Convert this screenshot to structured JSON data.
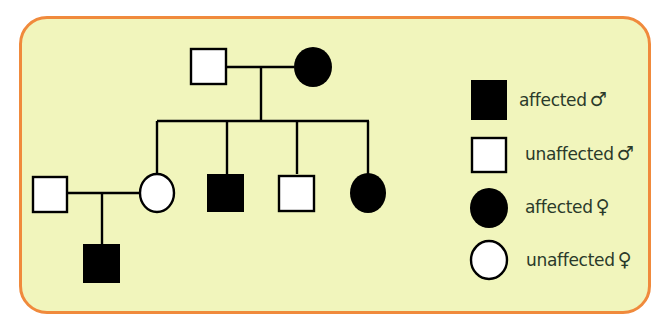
{
  "diagram": {
    "type": "pedigree chart",
    "generations": [
      {
        "gen": 1,
        "individuals": [
          {
            "id": "I-1",
            "sex": "male",
            "status": "unaffected"
          },
          {
            "id": "I-2",
            "sex": "female",
            "status": "affected"
          }
        ]
      },
      {
        "gen": 2,
        "individuals": [
          {
            "id": "II-spouse",
            "sex": "male",
            "status": "unaffected",
            "married_in": true
          },
          {
            "id": "II-1",
            "sex": "female",
            "status": "unaffected"
          },
          {
            "id": "II-2",
            "sex": "male",
            "status": "affected"
          },
          {
            "id": "II-3",
            "sex": "male",
            "status": "unaffected"
          },
          {
            "id": "II-4",
            "sex": "female",
            "status": "affected"
          }
        ]
      },
      {
        "gen": 3,
        "individuals": [
          {
            "id": "III-1",
            "sex": "male",
            "status": "affected"
          }
        ]
      }
    ]
  },
  "legend": {
    "items": [
      {
        "shape": "square",
        "fill": "black",
        "label": "affected",
        "symbol": "♂"
      },
      {
        "shape": "square",
        "fill": "white",
        "label": "unaffected",
        "symbol": "♂"
      },
      {
        "shape": "circle",
        "fill": "black",
        "label": "affected",
        "symbol": "♀"
      },
      {
        "shape": "circle",
        "fill": "white",
        "label": "unaffected",
        "symbol": "♀"
      }
    ]
  },
  "colors": {
    "background": "#f1f5bc",
    "border": "#f08a3c",
    "affected": "#000000",
    "unaffected": "#ffffff",
    "text": "#2a3a2a"
  }
}
